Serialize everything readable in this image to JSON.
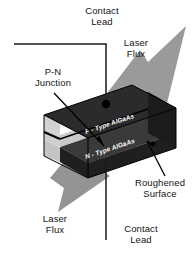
{
  "figure": {
    "type": "labeled-3d-diagram"
  },
  "labels": {
    "contact_lead_top": "Contact\nLead",
    "laser_flux_top": "Laser\nFlux",
    "pn_junction": "P-N\nJunction",
    "roughened_surface": "Roughened\nSurface",
    "laser_flux_bottom": "Laser\nFlux",
    "contact_lead_bottom": "Contact\nLead"
  },
  "slab": {
    "p_layer": "P - Type AlGaAs",
    "n_layer": "N - Type AlGaAs"
  },
  "colors": {
    "background": "#ffffff",
    "text": "#141414",
    "slab_top_dark": "#2a2a2a",
    "slab_face_dark": "#262626",
    "slab_layer_light": "#c9c9c9",
    "slab_layer_mid": "#a8a8a8",
    "arrow_gray": "#8f8f8f",
    "line_black": "#000000"
  }
}
